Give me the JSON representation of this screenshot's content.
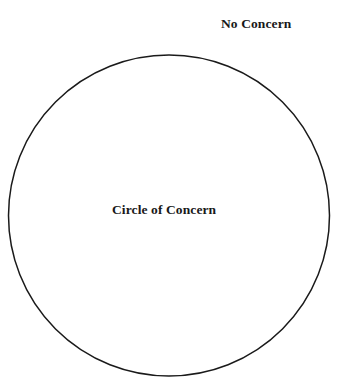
{
  "diagram": {
    "type": "venn-single-circle",
    "title": "Circle of Concern",
    "background_color": "#ffffff",
    "stroke_color": "#1a1a1a",
    "text_color": "#191919",
    "canvas": {
      "width": 350,
      "height": 388
    },
    "shapes": [
      {
        "name": "circle-of-concern",
        "kind": "circle",
        "cx": 169,
        "cy": 215.5,
        "r": 160.5,
        "fill": "none",
        "stroke": "#1a1a1a",
        "stroke_width": 1.5
      }
    ],
    "labels": [
      {
        "name": "no-concern",
        "text": "No Concern",
        "x": 221,
        "y": 16,
        "position": "outside-circle-top-right",
        "font_weight": "bold",
        "font_size": 13.5
      },
      {
        "name": "circle-of-concern",
        "text": "Circle of Concern",
        "x": 112,
        "y": 202,
        "position": "inside-circle-center",
        "font_weight": "bold",
        "font_size": 13.5
      }
    ]
  }
}
